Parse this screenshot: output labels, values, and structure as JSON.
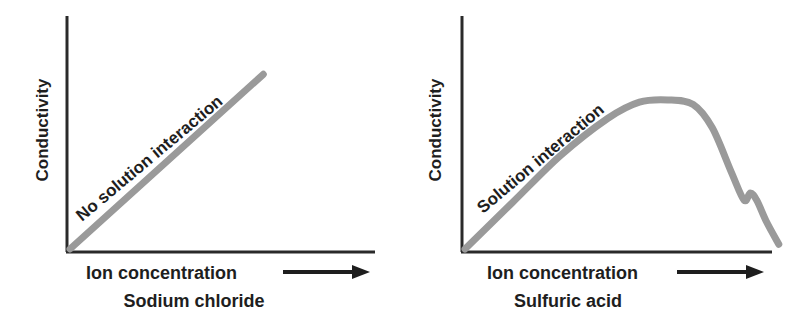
{
  "chart_data": [
    {
      "type": "line",
      "title": "",
      "xlabel": "Ion concentration",
      "xlabel_arrow": "right-arrow",
      "subtitle": "Sodium chloride",
      "ylabel": "Conductivity",
      "xlim": [
        0,
        1
      ],
      "ylim": [
        0,
        1
      ],
      "grid": false,
      "ticks": false,
      "annotation": "No solution interaction",
      "series": [
        {
          "name": "Sodium chloride",
          "x": [
            0.0,
            0.64
          ],
          "y": [
            0.0,
            0.75
          ]
        }
      ]
    },
    {
      "type": "line",
      "title": "",
      "xlabel": "Ion concentration",
      "xlabel_arrow": "right-arrow",
      "subtitle": "Sulfuric acid",
      "ylabel": "Conductivity",
      "xlim": [
        0,
        1
      ],
      "ylim": [
        0,
        1
      ],
      "grid": false,
      "ticks": false,
      "annotation": "Solution interaction",
      "series": [
        {
          "name": "Sulfuric acid",
          "x": [
            0.0,
            0.15,
            0.3,
            0.45,
            0.55,
            0.64,
            0.72,
            0.78,
            0.84,
            0.88,
            0.9,
            0.92,
            0.95,
            0.99
          ],
          "y": [
            0.0,
            0.2,
            0.4,
            0.56,
            0.63,
            0.64,
            0.62,
            0.52,
            0.33,
            0.21,
            0.24,
            0.21,
            0.12,
            0.02
          ]
        }
      ]
    }
  ]
}
